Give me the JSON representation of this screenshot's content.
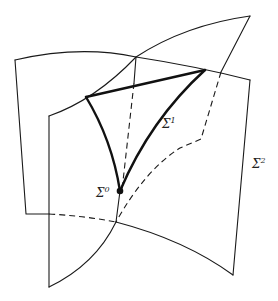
{
  "diagram": {
    "labels": {
      "sigma0": {
        "base": "Σ",
        "sup": "0"
      },
      "sigma1": {
        "base": "Σ",
        "sup": "1"
      },
      "sigma2": {
        "base": "Σ",
        "sup": "2"
      }
    },
    "colors": {
      "ink": "#1a1a1a",
      "background": "#ffffff"
    }
  }
}
